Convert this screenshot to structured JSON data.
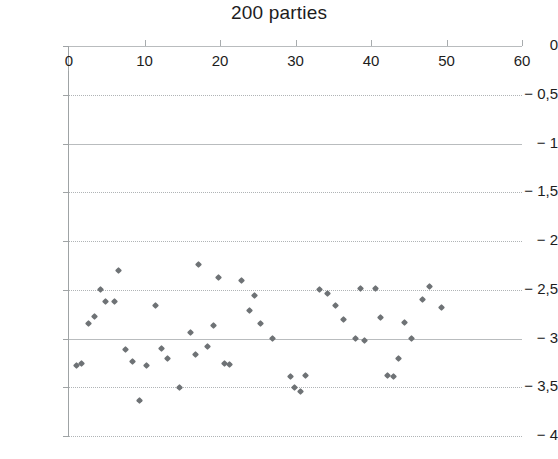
{
  "chart_data": {
    "type": "scatter",
    "title": "200 parties",
    "xlabel": "",
    "ylabel": "",
    "xlim": [
      0,
      60
    ],
    "ylim": [
      -4,
      0
    ],
    "grid": true,
    "legend": false,
    "marker": {
      "shape": "diamond",
      "color": "#6e7275",
      "size": 5
    },
    "decimal_separator": ",",
    "x_ticks": [
      0,
      10,
      20,
      30,
      40,
      50,
      60
    ],
    "x_tick_labels": [
      "0",
      "10",
      "20",
      "30",
      "40",
      "50",
      "60"
    ],
    "y_ticks": [
      0,
      -0.5,
      -1,
      -1.5,
      -2,
      -2.5,
      -3,
      -3.5,
      -4
    ],
    "y_tick_labels": [
      "0",
      "− 0,5",
      "− 1",
      "− 1,5",
      "− 2",
      "− 2,5",
      "− 3",
      "− 3,5",
      "− 4"
    ],
    "points": [
      {
        "x": 1.0,
        "y": -3.28
      },
      {
        "x": 1.7,
        "y": -3.26
      },
      {
        "x": 2.6,
        "y": -2.85
      },
      {
        "x": 3.4,
        "y": -2.77
      },
      {
        "x": 4.2,
        "y": -2.5
      },
      {
        "x": 4.9,
        "y": -2.62
      },
      {
        "x": 6.0,
        "y": -2.62
      },
      {
        "x": 6.6,
        "y": -2.3
      },
      {
        "x": 7.5,
        "y": -3.11
      },
      {
        "x": 8.4,
        "y": -3.24
      },
      {
        "x": 9.3,
        "y": -3.64
      },
      {
        "x": 10.2,
        "y": -3.28
      },
      {
        "x": 11.4,
        "y": -2.66
      },
      {
        "x": 12.2,
        "y": -3.1
      },
      {
        "x": 13.0,
        "y": -3.2
      },
      {
        "x": 14.7,
        "y": -3.5
      },
      {
        "x": 16.1,
        "y": -2.94
      },
      {
        "x": 16.8,
        "y": -3.16
      },
      {
        "x": 17.2,
        "y": -2.24
      },
      {
        "x": 18.4,
        "y": -3.08
      },
      {
        "x": 19.2,
        "y": -2.87
      },
      {
        "x": 19.8,
        "y": -2.37
      },
      {
        "x": 20.6,
        "y": -3.26
      },
      {
        "x": 21.3,
        "y": -3.27
      },
      {
        "x": 22.9,
        "y": -2.4
      },
      {
        "x": 23.9,
        "y": -2.71
      },
      {
        "x": 24.6,
        "y": -2.56
      },
      {
        "x": 25.4,
        "y": -2.85
      },
      {
        "x": 27.0,
        "y": -3.0
      },
      {
        "x": 29.3,
        "y": -3.39
      },
      {
        "x": 29.9,
        "y": -3.5
      },
      {
        "x": 30.6,
        "y": -3.54
      },
      {
        "x": 31.3,
        "y": -3.38
      },
      {
        "x": 33.2,
        "y": -2.5
      },
      {
        "x": 34.2,
        "y": -2.54
      },
      {
        "x": 35.3,
        "y": -2.66
      },
      {
        "x": 36.3,
        "y": -2.8
      },
      {
        "x": 38.0,
        "y": -3.0
      },
      {
        "x": 38.6,
        "y": -2.49
      },
      {
        "x": 39.1,
        "y": -3.02
      },
      {
        "x": 40.6,
        "y": -2.49
      },
      {
        "x": 41.3,
        "y": -2.78
      },
      {
        "x": 42.2,
        "y": -3.38
      },
      {
        "x": 43.0,
        "y": -3.39
      },
      {
        "x": 43.7,
        "y": -3.21
      },
      {
        "x": 44.5,
        "y": -2.84
      },
      {
        "x": 45.4,
        "y": -3.0
      },
      {
        "x": 46.8,
        "y": -2.6
      },
      {
        "x": 47.7,
        "y": -2.47
      },
      {
        "x": 49.3,
        "y": -2.68
      }
    ]
  }
}
